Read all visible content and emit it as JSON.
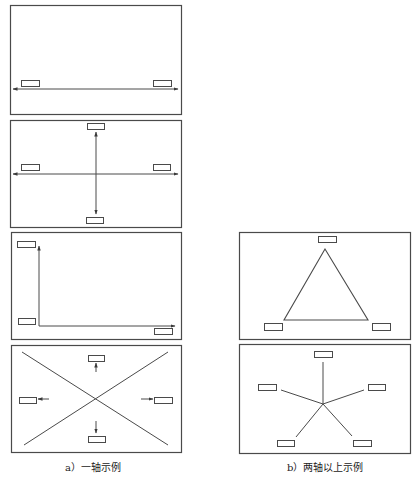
{
  "style": {
    "stroke": "#4a4a4a",
    "fill": "#ffffff"
  },
  "captions": {
    "left": "a）一轴示例",
    "right": "b）两轴以上示例"
  },
  "panels": [
    {
      "id": "one-axis-horizontal",
      "frame": [
        10,
        5,
        171,
        109
      ],
      "labels": [
        [
          21,
          80,
          18,
          6
        ],
        [
          153,
          80,
          18,
          6
        ]
      ],
      "lines": [],
      "arrows": [
        [
          96,
          89,
          13,
          89
        ],
        [
          96,
          89,
          178,
          89
        ]
      ]
    },
    {
      "id": "one-axis-cross",
      "frame": [
        10,
        120,
        171,
        107
      ],
      "labels": [
        [
          87,
          123,
          17,
          6
        ],
        [
          21,
          164,
          18,
          6
        ],
        [
          153,
          164,
          17,
          6
        ],
        [
          86,
          217,
          17,
          6
        ]
      ],
      "lines": [],
      "arrows": [
        [
          96,
          174,
          13,
          174
        ],
        [
          96,
          174,
          178,
          174
        ],
        [
          96,
          174,
          96,
          132
        ],
        [
          96,
          174,
          96,
          214
        ]
      ]
    },
    {
      "id": "one-axis-corner",
      "frame": [
        11,
        232,
        170,
        107
      ],
      "labels": [
        [
          17,
          241,
          18,
          6
        ],
        [
          18,
          318,
          17,
          6
        ],
        [
          154,
          328,
          18,
          6
        ]
      ],
      "lines": [],
      "arrows": [
        [
          39,
          326,
          39,
          246
        ],
        [
          39,
          326,
          175,
          326
        ]
      ]
    },
    {
      "id": "one-axis-x",
      "frame": [
        11,
        345,
        170,
        107
      ],
      "labels": [
        [
          88,
          355,
          16,
          6
        ],
        [
          19,
          397,
          17,
          6
        ],
        [
          154,
          397,
          18,
          6
        ],
        [
          88,
          436,
          17,
          6
        ]
      ],
      "lines": [
        [
          22,
          352,
          168,
          445
        ],
        [
          168,
          352,
          24,
          445
        ]
      ],
      "arrows": [
        [
          96,
          372,
          96,
          363
        ],
        [
          49,
          399,
          38,
          399
        ],
        [
          141,
          399,
          153,
          399
        ],
        [
          96,
          421,
          96,
          433
        ]
      ]
    },
    {
      "id": "multi-axis-triangle",
      "frame": [
        239,
        232,
        171,
        107
      ],
      "labels": [
        [
          318,
          236,
          18,
          6
        ],
        [
          264,
          323,
          18,
          7
        ],
        [
          372,
          323,
          18,
          7
        ]
      ],
      "polygon": [
        [
          325,
          249
        ],
        [
          284,
          320
        ],
        [
          368,
          320
        ]
      ],
      "lines": [],
      "arrows": []
    },
    {
      "id": "multi-axis-star",
      "frame": [
        239,
        344,
        171,
        109
      ],
      "labels": [
        [
          314,
          351,
          18,
          6
        ],
        [
          258,
          384,
          18,
          6
        ],
        [
          368,
          384,
          17,
          6
        ],
        [
          277,
          440,
          17,
          6
        ],
        [
          353,
          440,
          18,
          6
        ]
      ],
      "lines": [
        [
          323,
          404,
          323,
          362
        ],
        [
          323,
          404,
          281,
          390
        ],
        [
          323,
          404,
          364,
          390
        ],
        [
          323,
          404,
          296,
          437
        ],
        [
          323,
          404,
          352,
          436
        ]
      ],
      "arrows": []
    }
  ]
}
